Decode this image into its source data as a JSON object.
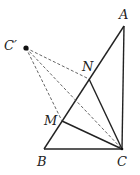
{
  "diagram": {
    "points": {
      "A": {
        "label": "A",
        "x": 124,
        "y": 26,
        "lx": 119,
        "ly": 19
      },
      "B": {
        "label": "B",
        "x": 44,
        "y": 149,
        "lx": 37,
        "ly": 166
      },
      "C": {
        "label": "C",
        "x": 122,
        "y": 149,
        "lx": 117,
        "ly": 166
      },
      "C_prime": {
        "label": "C′",
        "x": 26,
        "y": 48,
        "lx": 4,
        "ly": 48
      },
      "M": {
        "label": "M",
        "x": 62,
        "y": 121,
        "lx": 44,
        "ly": 125
      },
      "N": {
        "label": "N",
        "x": 89,
        "y": 79,
        "lx": 82,
        "ly": 70
      }
    },
    "solid_segments": [
      [
        "A",
        "B"
      ],
      [
        "A",
        "C"
      ],
      [
        "B",
        "C"
      ],
      [
        "N",
        "C"
      ],
      [
        "M",
        "C"
      ]
    ],
    "dashed_segments": [
      [
        "C_prime",
        "N"
      ],
      [
        "C_prime",
        "M"
      ],
      [
        "C_prime",
        "C"
      ]
    ]
  }
}
